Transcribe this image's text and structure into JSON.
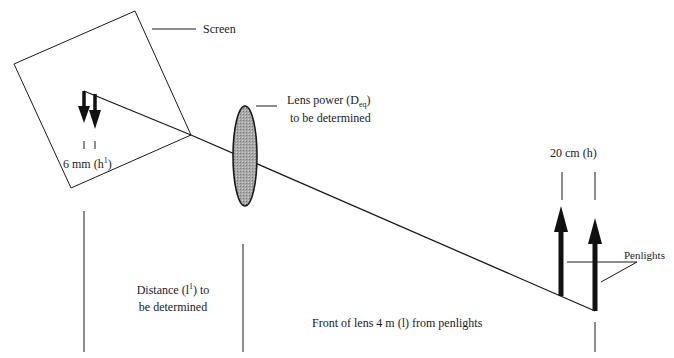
{
  "labels": {
    "screen": "Screen",
    "image_height_prefix": "6 mm (h",
    "image_height_sup": "1",
    "image_height_suffix": ")",
    "lens_power_line1_prefix": "Lens power  (D",
    "lens_power_line1_sub": "eq",
    "lens_power_line1_suffix": ")",
    "lens_power_line2": "to be determined",
    "object_height": "20 cm (h)",
    "penlights": "Penlights",
    "image_distance_line1_prefix": "Distance (l",
    "image_distance_line1_sup": "1",
    "image_distance_line1_suffix": ") to",
    "image_distance_line2": "be determined",
    "object_distance": "Front of lens 4 m (l) from penlights"
  },
  "colors": {
    "line": "#1a1a1a",
    "lens_fill": "#9a9a9a",
    "background": "#ffffff"
  },
  "elements": {
    "screen": "tilted-square",
    "lens": "ellipse",
    "image_arrows": 2,
    "object_arrows": 2,
    "ray": "single-line"
  }
}
